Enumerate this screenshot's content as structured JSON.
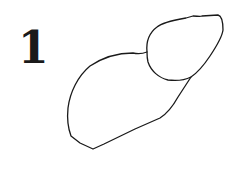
{
  "figure": {
    "label": "1",
    "stroke_color": "#1a1a1a",
    "background": "#ffffff"
  }
}
